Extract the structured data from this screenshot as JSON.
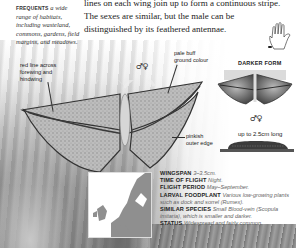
{
  "intro": {
    "lines": [
      "lines on each wing join up to form a continuous stripe.",
      "The sexes are similar, but the male can be",
      "distinguished by its feathered antennae."
    ]
  },
  "habitat": {
    "lead": "FREQUENTS",
    "text": "a wide range of habitats, including wasteland, commons, gardens, field margins, and meadows."
  },
  "annotations": {
    "red_line": "red line across forewing and hindwing",
    "pale_buff": "pale buff ground colour",
    "pinkish_edge": "pinkish outer edge",
    "darker_form": "DARKER FORM",
    "larva_length": "up to 2.5cm long"
  },
  "sex_symbols": {
    "main": "♂♀",
    "darker": "♂♀"
  },
  "icons": {
    "hand": "hand-scale-icon",
    "map": "europe-distribution-map"
  },
  "facts": [
    {
      "key": "WINGSPAN",
      "value": "3–3.5cm."
    },
    {
      "key": "TIME OF FLIGHT",
      "value": "Night."
    },
    {
      "key": "FLIGHT PERIOD",
      "value": "May–September."
    },
    {
      "key": "LARVAL FOODPLANT",
      "value": "Various low-growing plants such as dock and sorrel (Rumex)."
    },
    {
      "key": "SIMILAR SPECIES",
      "value": "Small Blood-vein (Scopula imitaria), which is smaller and darker."
    },
    {
      "key": "STATUS",
      "value": "Widespread and fairly common."
    }
  ]
}
